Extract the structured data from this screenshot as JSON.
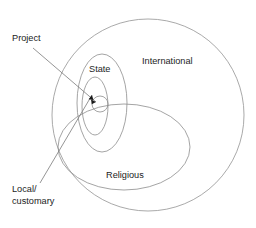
{
  "diagram": {
    "type": "nested-venn-rings",
    "title": "",
    "background_color": "#ffffff",
    "stroke_color": "#8d8d8d",
    "text_color": "#1c1c1c",
    "labels": {
      "international": "International",
      "state": "State",
      "religious": "Religious",
      "project": "Project",
      "local_line1": "Local/",
      "local_line2": "customary"
    },
    "rings": [
      {
        "name": "international",
        "shape": "circle",
        "cx": 148,
        "cy": 115,
        "r": 96
      },
      {
        "name": "state",
        "shape": "ellipse",
        "cx": 102,
        "cy": 103,
        "rx": 25,
        "ry": 49
      },
      {
        "name": "religious",
        "shape": "ellipse",
        "cx": 124,
        "cy": 147,
        "rx": 66,
        "ry": 43
      },
      {
        "name": "local-customary",
        "shape": "ellipse",
        "cx": 95,
        "cy": 106,
        "rx": 13,
        "ry": 29
      },
      {
        "name": "project",
        "shape": "circle",
        "cx": 100,
        "cy": 104,
        "r": 8
      }
    ],
    "leaders": [
      {
        "name": "project-leader",
        "from_label": "project",
        "tip_x": 98,
        "tip_y": 103
      },
      {
        "name": "local-customary-leader",
        "from_label": "local_line1",
        "tip_x": 93,
        "tip_y": 93
      }
    ]
  }
}
